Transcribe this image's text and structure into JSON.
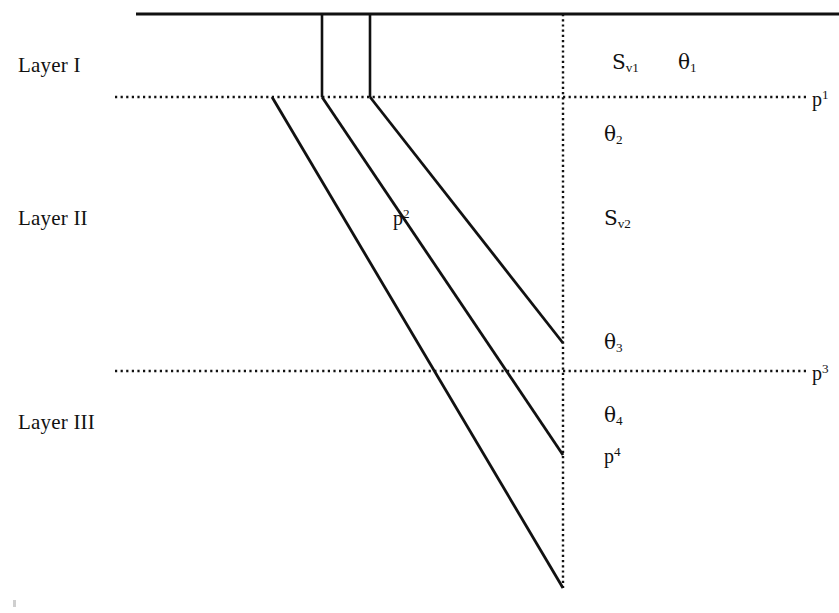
{
  "figure": {
    "background_color": "#ffffff",
    "line_color": "#000000",
    "canvas": {
      "width": 839,
      "height": 613
    }
  },
  "layers": [
    {
      "id": "layer-1",
      "label": "Layer I",
      "x": 18,
      "y": 55
    },
    {
      "id": "layer-2",
      "label": "Layer II",
      "x": 18,
      "y": 208
    },
    {
      "id": "layer-3",
      "label": "Layer III",
      "x": 18,
      "y": 412
    }
  ],
  "interface_labels": [
    {
      "id": "p1",
      "base": "p",
      "sup": "1",
      "x": 812,
      "y": 88
    },
    {
      "id": "p3",
      "base": "p",
      "sup": "3",
      "x": 812,
      "y": 362
    }
  ],
  "annotations": [
    {
      "id": "sv1",
      "base": "S",
      "sub": "v1",
      "sup": "",
      "x": 612,
      "y": 52
    },
    {
      "id": "theta1",
      "base": "θ",
      "sub": "1",
      "sup": "",
      "x": 678,
      "y": 52
    },
    {
      "id": "theta2",
      "base": "θ",
      "sub": "2",
      "sup": "",
      "x": 604,
      "y": 124
    },
    {
      "id": "sv2",
      "base": "S",
      "sub": "v2",
      "sup": "",
      "x": 604,
      "y": 208
    },
    {
      "id": "theta3",
      "base": "θ",
      "sub": "3",
      "sup": "",
      "x": 604,
      "y": 332
    },
    {
      "id": "theta4",
      "base": "θ",
      "sub": "4",
      "sup": "",
      "x": 604,
      "y": 405
    },
    {
      "id": "p4",
      "base": "p",
      "sub": "",
      "sup": "4",
      "x": 604,
      "y": 445
    },
    {
      "id": "p2",
      "base": "p",
      "sub": "",
      "sup": "2",
      "x": 393,
      "y": 207
    }
  ],
  "chart_data": {
    "type": "line",
    "xlabel": "",
    "ylabel": "",
    "surface": {
      "x1": 136,
      "y1": 14,
      "x2": 839,
      "y2": 14,
      "style": "solid",
      "width": 3
    },
    "interfaces": [
      {
        "name": "p1",
        "x1": 115,
        "y1": 97,
        "x2": 808,
        "y2": 97,
        "style": "dotted"
      },
      {
        "name": "p3",
        "x1": 115,
        "y1": 371,
        "x2": 808,
        "y2": 371,
        "style": "dotted"
      }
    ],
    "borehole_axis": {
      "name": "receiver-axis",
      "x1": 563,
      "y1": 14,
      "x2": 563,
      "y2": 588,
      "style": "dotted"
    },
    "source_verticals": [
      {
        "name": "source-vertical-a",
        "x1": 322,
        "y1": 14,
        "x2": 322,
        "y2": 97
      },
      {
        "name": "source-vertical-b",
        "x1": 370,
        "y1": 14,
        "x2": 370,
        "y2": 97
      }
    ],
    "rays": [
      {
        "name": "ray-1",
        "points": [
          [
            272,
            97
          ],
          [
            563,
            588
          ]
        ]
      },
      {
        "name": "ray-2",
        "points": [
          [
            322,
            97
          ],
          [
            563,
            455
          ]
        ]
      },
      {
        "name": "ray-3",
        "points": [
          [
            370,
            97
          ],
          [
            563,
            343
          ]
        ]
      }
    ],
    "crossing_point": {
      "name": "p2",
      "x": 427,
      "y": 204
    }
  }
}
